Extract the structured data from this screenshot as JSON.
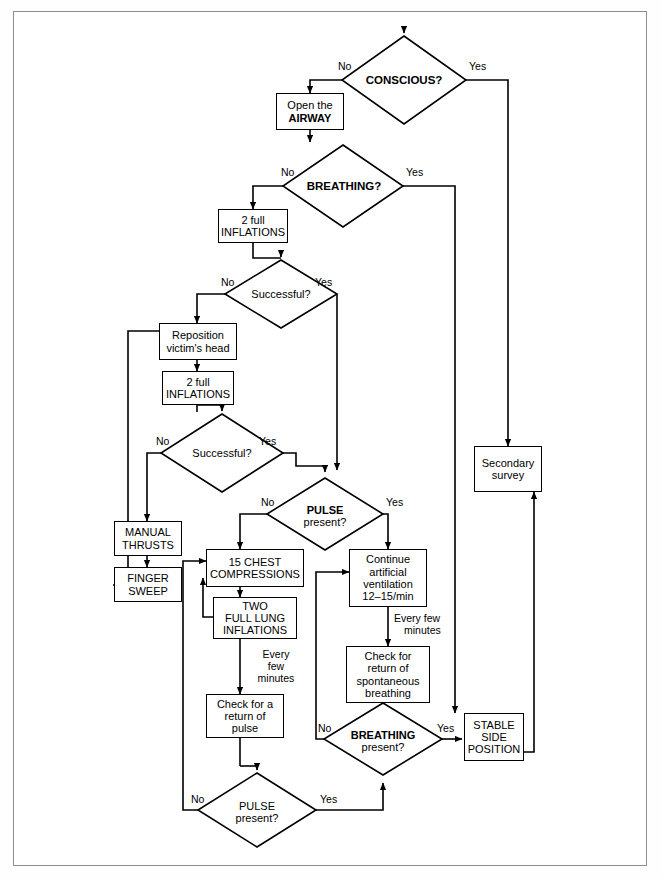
{
  "doc": {
    "kind": "flowchart",
    "title": "Basic Life Support / CPR decision flowchart",
    "background": "#ffffff",
    "line_color": "#000000",
    "frame_color": "#8d8d8d"
  },
  "nodes": {
    "conscious": {
      "type": "decision",
      "text": "CONSCIOUS?",
      "bold": true
    },
    "open_airway": {
      "type": "process",
      "line1": "Open the",
      "line2": "AIRWAY"
    },
    "breathing_top": {
      "type": "decision",
      "text": "BREATHING?",
      "bold": true
    },
    "two_full_inflations_1": {
      "type": "process",
      "line1": "2 full",
      "line2": "INFLATIONS"
    },
    "successful_1": {
      "type": "decision",
      "text": "Successful?"
    },
    "reposition": {
      "type": "process",
      "line1": "Reposition",
      "line2": "victim's head"
    },
    "two_full_inflations_2": {
      "type": "process",
      "line1": "2 full",
      "line2": "INFLATIONS"
    },
    "successful_2": {
      "type": "decision",
      "text": "Successful?"
    },
    "manual_thrusts": {
      "type": "process",
      "line1": "MANUAL",
      "line2": "THRUSTS"
    },
    "finger_sweep": {
      "type": "process",
      "line1": "FINGER",
      "line2": "SWEEP"
    },
    "pulse_top": {
      "type": "decision",
      "line1": "PULSE",
      "line2": "present?",
      "bold_line1": true
    },
    "chest_compressions": {
      "type": "process",
      "line1": "15 CHEST",
      "line2": "COMPRESSIONS"
    },
    "two_full_lung": {
      "type": "process",
      "line1": "TWO",
      "line2": "FULL LUNG",
      "line3": "INFLATIONS"
    },
    "check_pulse": {
      "type": "process",
      "line1": "Check for a",
      "line2": "return of",
      "line3": "pulse"
    },
    "pulse_bottom": {
      "type": "decision",
      "line1": "PULSE",
      "line2": "present?"
    },
    "continue_ventilation": {
      "type": "process",
      "line1": "Continue",
      "line2": "artificial",
      "line3": "ventilation",
      "line4": "12–15/min"
    },
    "check_breathing": {
      "type": "process",
      "line1": "Check for",
      "line2": "return of",
      "line3": "spontaneous",
      "line4": "breathing"
    },
    "breathing_bottom": {
      "type": "decision",
      "line1": "BREATHING",
      "line2": "present?",
      "bold_line1": true
    },
    "stable_side": {
      "type": "process",
      "line1": "STABLE",
      "line2": "SIDE",
      "line3": "POSITION"
    },
    "secondary_survey": {
      "type": "process",
      "line1": "Secondary",
      "line2": "survey"
    }
  },
  "edge_labels": {
    "conscious_no": "No",
    "conscious_yes": "Yes",
    "breathing_top_no": "No",
    "breathing_top_yes": "Yes",
    "successful_1_no": "No",
    "successful_1_yes": "Yes",
    "successful_2_no": "No",
    "successful_2_yes": "Yes",
    "pulse_top_no": "No",
    "pulse_top_yes": "Yes",
    "every_few_minutes_left_l1": "Every",
    "every_few_minutes_left_l2": "few",
    "every_few_minutes_left_l3": "minutes",
    "every_few_minutes_right_l1": "Every few",
    "every_few_minutes_right_l2": "minutes",
    "breathing_bottom_no": "No",
    "breathing_bottom_yes": "Yes",
    "pulse_bottom_no": "No",
    "pulse_bottom_yes": "Yes"
  }
}
